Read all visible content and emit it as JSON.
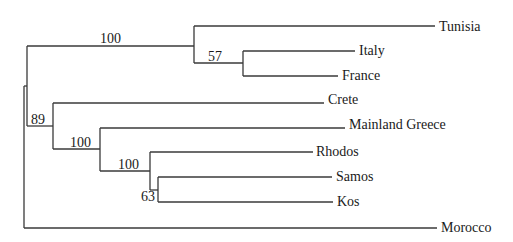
{
  "tree": {
    "type": "phylogenetic-tree",
    "taxa": [
      {
        "name": "Tunisia",
        "y": 26,
        "x_end": 435
      },
      {
        "name": "Italy",
        "y": 51,
        "x_end": 355
      },
      {
        "name": "France",
        "y": 76,
        "x_end": 338
      },
      {
        "name": "Crete",
        "y": 100,
        "x_end": 324
      },
      {
        "name": "Mainland Greece",
        "y": 125,
        "x_end": 345
      },
      {
        "name": "Rhodos",
        "y": 152,
        "x_end": 313
      },
      {
        "name": "Samos",
        "y": 177,
        "x_end": 332
      },
      {
        "name": "Kos",
        "y": 202,
        "x_end": 333
      },
      {
        "name": "Morocco",
        "y": 228,
        "x_end": 437
      }
    ],
    "support_values": [
      {
        "value": "100",
        "clade": "Tunisia, Italy, France"
      },
      {
        "value": "57",
        "clade": "Italy, France"
      },
      {
        "value": "89",
        "clade": "Crete, Mainland Greece, Rhodos, Samos, Kos"
      },
      {
        "value": "100",
        "clade": "Mainland Greece, Rhodos, Samos, Kos"
      },
      {
        "value": "100",
        "clade": "Rhodos, Samos, Kos"
      },
      {
        "value": "63",
        "clade": "Samos, Kos"
      }
    ]
  },
  "labels": {
    "tunisia": "Tunisia",
    "italy": "Italy",
    "france": "France",
    "crete": "Crete",
    "mainland_greece": "Mainland Greece",
    "rhodos": "Rhodos",
    "samos": "Samos",
    "kos": "Kos",
    "morocco": "Morocco"
  },
  "support": {
    "n_tunisia_clade": "100",
    "n_italy_france": "57",
    "n_greek_clade": "89",
    "n_mainland_islands": "100",
    "n_islands": "100",
    "n_samos_kos": "63"
  }
}
